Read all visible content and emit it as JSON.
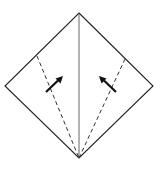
{
  "diagram": {
    "type": "origami-fold-step",
    "colors": {
      "background": "#ffffff",
      "outline": "#222222",
      "crease": "#555555",
      "dashed_fold": "#333333",
      "arrow": "#111111"
    },
    "vertices": {
      "top": [
        79,
        13
      ],
      "left": [
        5,
        86
      ],
      "right": [
        153,
        86
      ],
      "bottom": [
        79,
        158
      ]
    },
    "center_crease": {
      "from": [
        79,
        13
      ],
      "to": [
        79,
        158
      ]
    },
    "fold_lines": [
      {
        "name": "left-valley-fold",
        "from": [
          37,
          56
        ],
        "to": [
          79,
          158
        ]
      },
      {
        "name": "right-valley-fold",
        "from": [
          125,
          59
        ],
        "to": [
          79,
          158
        ]
      }
    ],
    "arrows": [
      {
        "name": "left-fold-arrow",
        "from": [
          46,
          92
        ],
        "to": [
          62,
          77
        ],
        "direction": "up-right"
      },
      {
        "name": "right-fold-arrow",
        "from": [
          116,
          92
        ],
        "to": [
          100,
          77
        ],
        "direction": "up-left"
      }
    ]
  }
}
